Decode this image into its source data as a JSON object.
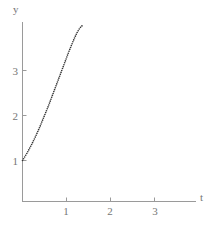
{
  "chart_data": {
    "type": "scatter",
    "title": "",
    "subtitle": "",
    "xlabel": "t",
    "ylabel": "y",
    "grid": false,
    "legend": null,
    "style": "dotted-curve",
    "xlim": [
      0,
      3.95
    ],
    "ylim": [
      0,
      4.35
    ],
    "x_ticks": [
      1,
      2,
      3
    ],
    "x_tick_labels": [
      "1",
      "2",
      "3"
    ],
    "y_ticks": [
      1,
      2,
      3
    ],
    "y_tick_labels": [
      "1",
      "2",
      "3"
    ],
    "x": [
      0.0,
      0.05,
      0.1,
      0.15,
      0.2,
      0.25,
      0.3,
      0.35,
      0.4,
      0.45,
      0.5,
      0.55,
      0.6,
      0.65,
      0.7,
      0.75,
      0.8,
      0.85,
      0.9,
      0.95,
      1.0,
      1.05,
      1.1,
      1.15,
      1.2,
      1.25,
      1.3,
      1.35,
      1.39
    ],
    "values": [
      1.0,
      1.08,
      1.16,
      1.25,
      1.34,
      1.44,
      1.54,
      1.65,
      1.76,
      1.88,
      2.0,
      2.12,
      2.24,
      2.37,
      2.5,
      2.63,
      2.76,
      2.89,
      3.02,
      3.15,
      3.28,
      3.41,
      3.53,
      3.65,
      3.76,
      3.86,
      3.94,
      3.99,
      4.0
    ],
    "series": [
      {
        "name": "y(t)",
        "marker": "dot",
        "color": "#333333",
        "points": [
          [
            0.0,
            1.0
          ],
          [
            0.27,
            1.49
          ],
          [
            0.61,
            2.0
          ],
          [
            1.02,
            3.0
          ],
          [
            1.39,
            4.0
          ]
        ]
      }
    ],
    "annotations": []
  },
  "axes": {
    "x_axis_label": "t",
    "y_axis_label": "y",
    "x_tick_labels": [
      "1",
      "2",
      "3"
    ],
    "y_tick_labels": [
      "1",
      "2",
      "3"
    ]
  },
  "colors": {
    "background": "#ffffff",
    "axis": "#9a9a9a",
    "tick_text": "#767676",
    "curve": "#333333"
  }
}
